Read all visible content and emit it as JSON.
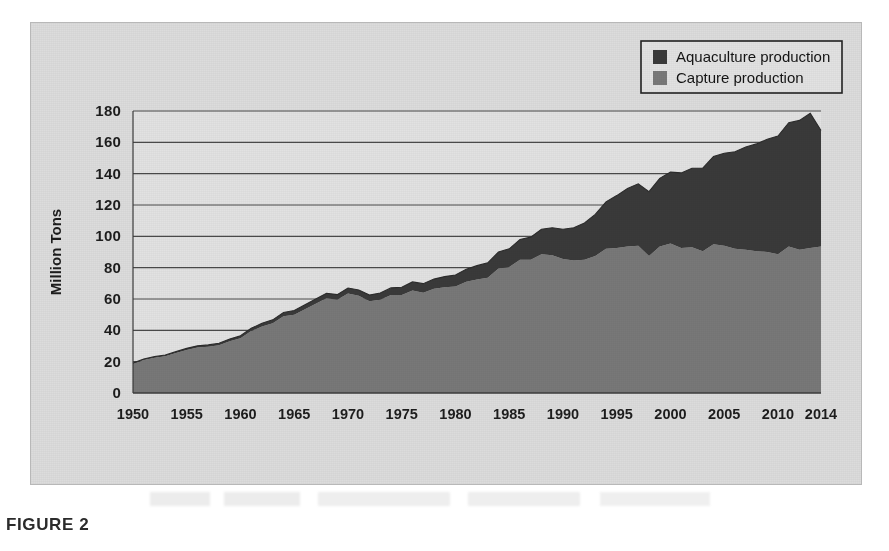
{
  "figure": {
    "caption": "FIGURE 2"
  },
  "legend": {
    "position": "top-right",
    "items": [
      {
        "label": "Aquaculture production",
        "color": "#3a3a3a",
        "swatch": "legend-swatch-aquaculture"
      },
      {
        "label": "Capture production",
        "color": "#787878",
        "swatch": "legend-swatch-capture"
      }
    ]
  },
  "colors": {
    "panel_background": "#dcdcdc",
    "plot_background": "#e2e2e2",
    "aquaculture": "#3a3a3a",
    "capture": "#787878",
    "gridline": "#4a4a4a",
    "axis": "#3c3c3c",
    "text": "#1d1d1d"
  },
  "chart_data": {
    "type": "area",
    "stacked": true,
    "title": "",
    "xlabel": "",
    "ylabel": "Million Tons",
    "xlim": [
      1950,
      2014
    ],
    "ylim": [
      0,
      180
    ],
    "ytick_step": 20,
    "grid": true,
    "legend_position": "top-right",
    "ytick_labels": [
      "0",
      "20",
      "40",
      "60",
      "80",
      "100",
      "120",
      "140",
      "160",
      "180"
    ],
    "ytick_values": [
      0,
      20,
      40,
      60,
      80,
      100,
      120,
      140,
      160,
      180
    ],
    "xtick_labels": [
      "1950",
      "1955",
      "1960",
      "1965",
      "1970",
      "1975",
      "1980",
      "1985",
      "1990",
      "1995",
      "2000",
      "2005",
      "2010",
      "2014"
    ],
    "xtick_values": [
      1950,
      1955,
      1960,
      1965,
      1970,
      1975,
      1980,
      1985,
      1990,
      1995,
      2000,
      2005,
      2010,
      2014
    ],
    "x": [
      1950,
      1951,
      1952,
      1953,
      1954,
      1955,
      1956,
      1957,
      1958,
      1959,
      1960,
      1961,
      1962,
      1963,
      1964,
      1965,
      1966,
      1967,
      1968,
      1969,
      1970,
      1971,
      1972,
      1973,
      1974,
      1975,
      1976,
      1977,
      1978,
      1979,
      1980,
      1981,
      1982,
      1983,
      1984,
      1985,
      1986,
      1987,
      1988,
      1989,
      1990,
      1991,
      1992,
      1993,
      1994,
      1995,
      1996,
      1997,
      1998,
      1999,
      2000,
      2001,
      2002,
      2003,
      2004,
      2005,
      2006,
      2007,
      2008,
      2009,
      2010,
      2011,
      2012,
      2013,
      2014
    ],
    "series": [
      {
        "name": "Capture production",
        "color": "#787878",
        "values": [
          18.5,
          21.0,
          22.5,
          23.5,
          25.5,
          27.5,
          29.0,
          29.5,
          30.5,
          33.0,
          35.0,
          39.5,
          42.5,
          44.5,
          49.0,
          50.0,
          53.5,
          57.0,
          60.5,
          59.5,
          63.5,
          62.0,
          58.5,
          59.5,
          62.5,
          62.5,
          65.5,
          64.0,
          66.5,
          67.5,
          68.0,
          71.0,
          72.5,
          73.5,
          79.5,
          80.5,
          85.0,
          85.0,
          88.5,
          88.0,
          85.5,
          84.5,
          85.0,
          87.5,
          92.0,
          92.5,
          93.5,
          94.0,
          87.5,
          93.5,
          95.5,
          92.5,
          93.0,
          90.5,
          95.0,
          94.0,
          92.0,
          91.5,
          90.5,
          90.0,
          88.5,
          93.5,
          91.5,
          92.5,
          93.5
        ]
      },
      {
        "name": "Aquaculture production",
        "color": "#3a3a3a",
        "values": [
          0.6,
          0.7,
          0.7,
          0.8,
          0.9,
          1.0,
          1.1,
          1.2,
          1.3,
          1.4,
          1.6,
          1.8,
          2.0,
          2.2,
          2.4,
          2.6,
          2.8,
          3.0,
          3.2,
          3.3,
          3.5,
          3.7,
          4.0,
          4.3,
          4.6,
          5.0,
          5.4,
          5.8,
          6.2,
          6.8,
          7.3,
          8.0,
          8.8,
          9.6,
          10.5,
          11.5,
          13.0,
          14.5,
          16.0,
          17.5,
          19.0,
          21.0,
          23.5,
          26.5,
          30.0,
          33.5,
          37.0,
          39.5,
          41.0,
          43.5,
          45.5,
          48.0,
          50.5,
          53.0,
          56.0,
          59.0,
          62.0,
          65.5,
          68.5,
          72.0,
          75.5,
          79.0,
          82.5,
          86.0,
          74.0
        ]
      }
    ],
    "totals": [
      19.1,
      21.7,
      23.2,
      24.3,
      26.4,
      28.5,
      30.1,
      30.7,
      31.8,
      34.4,
      36.6,
      41.3,
      44.5,
      46.7,
      51.4,
      52.6,
      56.3,
      60.0,
      63.7,
      62.8,
      67.0,
      65.7,
      62.5,
      63.8,
      67.1,
      67.5,
      70.9,
      69.8,
      72.7,
      74.3,
      75.3,
      79.0,
      81.3,
      83.1,
      90.0,
      92.0,
      98.0,
      99.5,
      104.5,
      105.5,
      104.5,
      105.5,
      108.5,
      114.0,
      122.0,
      126.0,
      130.5,
      133.5,
      128.5,
      137.0,
      141.0,
      140.5,
      143.5,
      143.5,
      151.0,
      153.0,
      154.0,
      157.0,
      159.0,
      162.0,
      164.0,
      172.5,
      174.0,
      178.5,
      167.5
    ],
    "annotations": []
  }
}
